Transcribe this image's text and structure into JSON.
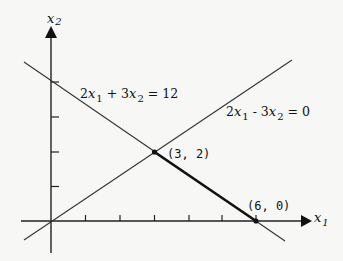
{
  "diagram": {
    "type": "linear-program-feasible-region",
    "axes": {
      "x_label": {
        "var": "x",
        "sub": "1"
      },
      "y_label": {
        "var": "x",
        "sub": "2"
      },
      "x_ticks": [
        1,
        2,
        3,
        4,
        5,
        6
      ],
      "y_ticks": [
        1,
        2,
        3,
        4
      ]
    },
    "lines": [
      {
        "id": "constraint-1",
        "equation": "2x1 + 3x2 = 12",
        "label_parts": {
          "c1": "2",
          "v1": "x",
          "s1": "1",
          "op": " + ",
          "c2": "3",
          "v2": "x",
          "s2": "2",
          "rhs": " = 12"
        },
        "endpoints": [
          [
            -0.8,
            4.53
          ],
          [
            6.8,
            -0.53
          ]
        ]
      },
      {
        "id": "constraint-2",
        "equation": "2x1 - 3x2 = 0",
        "label_parts": {
          "c1": "2",
          "v1": "x",
          "s1": "1",
          "op": " - ",
          "c2": "3",
          "v2": "x",
          "s2": "2",
          "rhs": " = 0"
        },
        "endpoints": [
          [
            -0.8,
            -0.53
          ],
          [
            7.0,
            4.67
          ]
        ]
      }
    ],
    "highlighted_segment": {
      "from": [
        3,
        2
      ],
      "to": [
        6,
        0
      ]
    },
    "points": [
      {
        "label": "(3, 2)",
        "x": 3,
        "y": 2
      },
      {
        "label": "(6, 0)",
        "x": 6,
        "y": 0
      }
    ],
    "colors": {
      "background": "#f7f7f5",
      "ink": "#111111"
    }
  }
}
